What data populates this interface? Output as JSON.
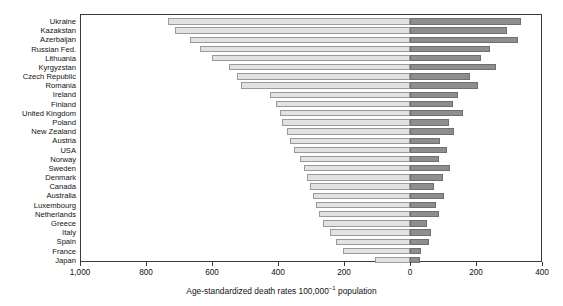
{
  "chart_data": {
    "type": "bar",
    "orientation": "horizontal",
    "subtype": "diverging-bidirectional",
    "title": "",
    "xlabel": "Age-standardized death rates 100,000⁻¹ population",
    "ylabel": "",
    "xlabel_parts": {
      "prefix": "Age-standardized death rates 100,000",
      "exponent": "−1",
      "suffix": " population"
    },
    "grid": false,
    "legend": false,
    "axis_left_max": 1000,
    "axis_right_max": 400,
    "xlim": [
      -1000,
      400
    ],
    "xticks": [
      -1000,
      -800,
      -600,
      -400,
      -200,
      0,
      200,
      400
    ],
    "xtick_labels": [
      "1,000",
      "800",
      "600",
      "400",
      "200",
      "0",
      "200",
      "400"
    ],
    "categories": [
      "Ukraine",
      "Kazakstan",
      "Azerbaijan",
      "Russian Fed.",
      "Lithuania",
      "Kyrgyzstan",
      "Czech Republic",
      "Romania",
      "Ireland",
      "Finland",
      "United Kingdom",
      "Poland",
      "New Zealand",
      "Austria",
      "USA",
      "Norway",
      "Sweden",
      "Denmark",
      "Canada",
      "Australia",
      "Luxembourg",
      "Netherlands",
      "Greece",
      "Italy",
      "Spain",
      "France",
      "Japan"
    ],
    "series": [
      {
        "name": "left",
        "color": "#e2e2e2",
        "values": [
          733,
          712,
          666,
          636,
          600,
          548,
          524,
          512,
          424,
          406,
          394,
          388,
          373,
          364,
          352,
          333,
          321,
          312,
          303,
          294,
          285,
          276,
          264,
          242,
          224,
          203,
          106
        ]
      },
      {
        "name": "right",
        "color": "#8e8e8e",
        "values": [
          336,
          294,
          327,
          242,
          215,
          261,
          182,
          206,
          145,
          130,
          160,
          118,
          133,
          91,
          112,
          88,
          121,
          100,
          73,
          103,
          79,
          88,
          52,
          64,
          58,
          33,
          30
        ]
      }
    ]
  },
  "axis": {
    "zero_position_px": 410,
    "left_edge_px": 80,
    "right_edge_px": 542
  },
  "colors": {
    "bar_left": "#e2e2e2",
    "bar_left_border": "#9a9a9a",
    "bar_right": "#8e8e8e",
    "bar_right_border": "#6f6f6f",
    "frame": "#3a3a3a",
    "text": "#111111",
    "background": "#ffffff"
  }
}
